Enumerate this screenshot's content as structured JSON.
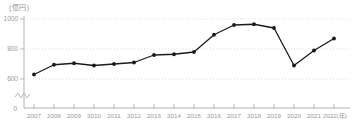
{
  "chart_data": {
    "type": "line",
    "title": "",
    "unit": "(億円)",
    "categories": [
      "2007",
      "2008",
      "2009",
      "2010",
      "2011",
      "2012",
      "2013",
      "2014",
      "2015",
      "2016",
      "2017",
      "2018",
      "2019",
      "2020",
      "2021",
      "2022"
    ],
    "x_last_suffix": "(年)",
    "values": [
      630,
      695,
      705,
      690,
      700,
      710,
      760,
      765,
      780,
      895,
      960,
      965,
      940,
      690,
      790,
      870
    ],
    "y_ticks": [
      600,
      800,
      1000
    ],
    "y_origin_label": "0",
    "ylim": [
      600,
      1000
    ],
    "axis_break": true,
    "grid": "dotted horizontal",
    "legend": "none",
    "colors": {
      "line": "#1a1a1a",
      "marker": "#1a1a1a",
      "grid": "#cccccc",
      "axis": "#aaaaaa",
      "label": "#999999"
    }
  }
}
